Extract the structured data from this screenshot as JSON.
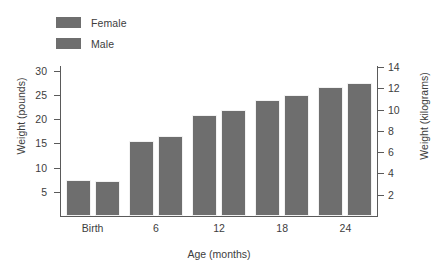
{
  "chart_data": {
    "type": "bar",
    "title": "",
    "xlabel": "Age (months)",
    "ylabel": "Weight (pounds)",
    "ylabel_secondary": "Weight (kilograms)",
    "categories": [
      "Birth",
      "6",
      "12",
      "18",
      "24"
    ],
    "series": [
      {
        "name": "Female",
        "color": "#6e6e6e",
        "values": [
          7.4,
          15.6,
          20.8,
          24.0,
          26.7
        ]
      },
      {
        "name": "Male",
        "color": "#6e6e6e",
        "values": [
          7.3,
          16.6,
          22.0,
          25.1,
          27.4
        ]
      }
    ],
    "ylim": [
      0,
      31
    ],
    "ylim_secondary": [
      0,
      14.1
    ],
    "yticks": [
      "5",
      "10",
      "15",
      "20",
      "25",
      "30"
    ],
    "ytick_values": [
      5,
      10,
      15,
      20,
      25,
      30
    ],
    "yticks_secondary": [
      "2",
      "4",
      "6",
      "8",
      "10",
      "12",
      "14"
    ],
    "ytick_values_secondary": [
      2,
      4,
      6,
      8,
      10,
      12,
      14
    ],
    "grid": false,
    "legend_position": "top-left"
  },
  "legend": {
    "items": [
      {
        "label": "Female",
        "color": "#6e6e6e"
      },
      {
        "label": "Male",
        "color": "#6e6e6e"
      }
    ]
  },
  "colors": {
    "bar_fill": "#6e6e6e",
    "axis": "#5a5a5a",
    "text": "#3d3d3d",
    "background": "#ffffff"
  }
}
